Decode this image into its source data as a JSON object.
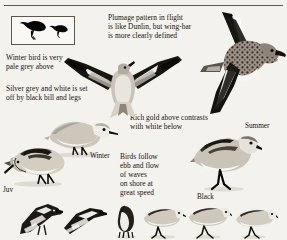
{
  "page": {
    "background_color": "#f4f2ec",
    "ink_color": "#14110c",
    "has_top_rule": true
  },
  "silhouette_box": {
    "name": "silhouette-comparison-box",
    "border_color": "#5d574e",
    "fill_color": "#faf8f4",
    "birds": [
      "large-perched-silhouette",
      "small-perched-silhouette"
    ]
  },
  "notes": {
    "plumage": "Plumage pattern in flight\nis like Dunlin, but wing-bar\nis more clearly defined",
    "winter": "Winter bird is very\npale grey above",
    "silver": "Silver grey and white is set\noff by black bill and legs",
    "gold": "Rich gold above contrasts\nwith white below",
    "ebb": "Birds follow\nebb and flow\nof waves\non shore at\ngreat speed"
  },
  "labels": {
    "winter": "Winter",
    "juv": "Juv",
    "summer": "Summer",
    "black": "Black"
  },
  "illustrations": [
    {
      "name": "flying-bird-summer-plumage",
      "position": "top-right"
    },
    {
      "name": "flying-bird-winter-plumage",
      "position": "center"
    },
    {
      "name": "standing-bird-winter-plumage",
      "position": "center-left"
    },
    {
      "name": "standing-bird-juvenile",
      "position": "bottom-left"
    },
    {
      "name": "standing-bird-black-legs",
      "position": "right"
    }
  ],
  "bottom_strip": [
    {
      "name": "small-bird-flying-1"
    },
    {
      "name": "small-bird-flying-2"
    },
    {
      "name": "small-bird-preening"
    },
    {
      "name": "small-bird-standing-1"
    },
    {
      "name": "small-bird-standing-2"
    },
    {
      "name": "small-bird-standing-3"
    }
  ]
}
